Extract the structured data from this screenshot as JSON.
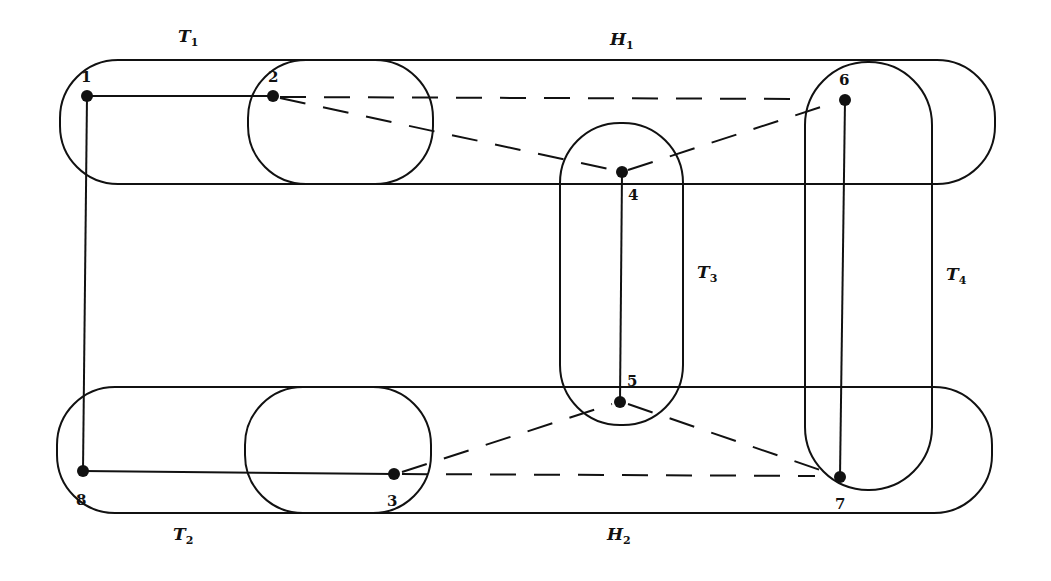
{
  "diagram": {
    "type": "hypergraph",
    "set_labels": {
      "T1": {
        "main": "T",
        "sub": "1"
      },
      "T2": {
        "main": "T",
        "sub": "2"
      },
      "T3": {
        "main": "T",
        "sub": "3"
      },
      "T4": {
        "main": "T",
        "sub": "4"
      },
      "H1": {
        "main": "H",
        "sub": "1"
      },
      "H2": {
        "main": "H",
        "sub": "2"
      }
    },
    "nodes": [
      {
        "id": "1",
        "label": "1"
      },
      {
        "id": "2",
        "label": "2"
      },
      {
        "id": "3",
        "label": "3"
      },
      {
        "id": "4",
        "label": "4"
      },
      {
        "id": "5",
        "label": "5"
      },
      {
        "id": "6",
        "label": "6"
      },
      {
        "id": "7",
        "label": "7"
      },
      {
        "id": "8",
        "label": "8"
      }
    ],
    "solid_edges": [
      [
        "1",
        "2"
      ],
      [
        "1",
        "8"
      ],
      [
        "8",
        "3"
      ],
      [
        "4",
        "5"
      ],
      [
        "6",
        "7"
      ]
    ],
    "dashed_edges": [
      [
        "2",
        "6"
      ],
      [
        "2",
        "4"
      ],
      [
        "4",
        "6"
      ],
      [
        "3",
        "7"
      ],
      [
        "3",
        "5"
      ],
      [
        "5",
        "7"
      ]
    ],
    "sets": {
      "H1": [
        "1",
        "2",
        "4",
        "6"
      ],
      "H2": [
        "8",
        "3",
        "5",
        "7"
      ],
      "T1": [
        "2"
      ],
      "T2": [
        "3"
      ],
      "T3": [
        "4",
        "5"
      ],
      "T4": [
        "6",
        "7"
      ]
    }
  }
}
